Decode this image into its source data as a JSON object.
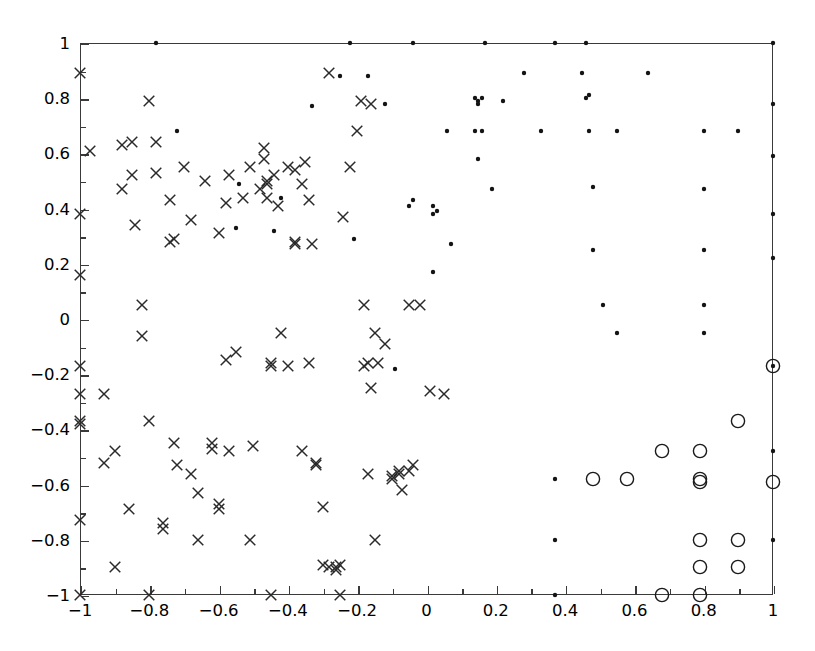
{
  "chart_data": {
    "type": "scatter",
    "title": "",
    "subtitle": "",
    "xlabel": "",
    "ylabel": "",
    "xlim": [
      -1,
      1
    ],
    "ylim": [
      -1,
      1
    ],
    "grid": false,
    "legend_position": "none",
    "x_ticks": [
      -1,
      -0.8,
      -0.6,
      -0.4,
      -0.2,
      0,
      0.2,
      0.4,
      0.6,
      0.8,
      1
    ],
    "x_tick_labels": [
      "-1",
      "-0.8",
      "-0.6",
      "-0.4",
      "-0.2",
      "0",
      "0.2",
      "0.4",
      "0.6",
      "0.8",
      "1"
    ],
    "y_ticks": [
      -1,
      -0.8,
      -0.6,
      -0.4,
      -0.2,
      0,
      0.2,
      0.4,
      0.6,
      0.8,
      1
    ],
    "y_tick_labels": [
      "-1",
      "-0.8",
      "-0.6",
      "-0.4",
      "-0.2",
      "0",
      "0.2",
      "0.4",
      "0.6",
      "0.8",
      "1"
    ],
    "minor_ticks": true,
    "marker_color": "#1a1a1a",
    "axis_color": "#3a3a3a",
    "series": [
      {
        "name": "cross-markers",
        "marker": "x",
        "size": 13,
        "color": "#2a2a2a",
        "points": [
          [
            -1.0,
            0.89
          ],
          [
            -1.0,
            0.38
          ],
          [
            -1.0,
            0.16
          ],
          [
            -1.0,
            -0.17
          ],
          [
            -1.0,
            -0.27
          ],
          [
            -1.0,
            -0.37
          ],
          [
            -1.0,
            -0.38
          ],
          [
            -1.0,
            -0.73
          ],
          [
            -1.0,
            -1.0
          ],
          [
            -0.97,
            0.61
          ],
          [
            -0.93,
            -0.27
          ],
          [
            -0.93,
            -0.52
          ],
          [
            -0.9,
            -0.9
          ],
          [
            -0.9,
            -0.48
          ],
          [
            -0.88,
            0.63
          ],
          [
            -0.88,
            0.47
          ],
          [
            -0.86,
            -0.69
          ],
          [
            -0.85,
            0.64
          ],
          [
            -0.85,
            0.52
          ],
          [
            -0.84,
            0.34
          ],
          [
            -0.82,
            0.05
          ],
          [
            -0.82,
            -0.06
          ],
          [
            -0.8,
            0.79
          ],
          [
            -0.8,
            -0.37
          ],
          [
            -0.8,
            -1.0
          ],
          [
            -0.78,
            0.53
          ],
          [
            -0.78,
            0.64
          ],
          [
            -0.76,
            -0.74
          ],
          [
            -0.76,
            -0.76
          ],
          [
            -0.74,
            0.43
          ],
          [
            -0.74,
            0.28
          ],
          [
            -0.73,
            0.29
          ],
          [
            -0.73,
            -0.45
          ],
          [
            -0.72,
            -0.53
          ],
          [
            -0.7,
            0.55
          ],
          [
            -0.68,
            0.36
          ],
          [
            -0.68,
            -0.56
          ],
          [
            -0.66,
            -0.8
          ],
          [
            -0.66,
            -0.63
          ],
          [
            -0.64,
            0.5
          ],
          [
            -0.62,
            -0.45
          ],
          [
            -0.62,
            -0.47
          ],
          [
            -0.6,
            0.31
          ],
          [
            -0.6,
            -0.69
          ],
          [
            -0.6,
            -0.67
          ],
          [
            -0.58,
            0.42
          ],
          [
            -0.58,
            -0.15
          ],
          [
            -0.57,
            0.52
          ],
          [
            -0.57,
            -0.48
          ],
          [
            -0.55,
            -0.12
          ],
          [
            -0.53,
            0.44
          ],
          [
            -0.51,
            0.55
          ],
          [
            -0.51,
            -0.8
          ],
          [
            -0.5,
            -0.46
          ],
          [
            -0.48,
            0.47
          ],
          [
            -0.47,
            0.62
          ],
          [
            -0.47,
            0.58
          ],
          [
            -0.46,
            0.49
          ],
          [
            -0.46,
            0.5
          ],
          [
            -0.46,
            0.44
          ],
          [
            -0.45,
            -0.17
          ],
          [
            -0.45,
            -0.16
          ],
          [
            -0.44,
            0.52
          ],
          [
            -0.43,
            0.41
          ],
          [
            -0.42,
            -0.05
          ],
          [
            -0.4,
            0.55
          ],
          [
            -0.4,
            -0.17
          ],
          [
            -0.38,
            0.54
          ],
          [
            -0.38,
            0.27
          ],
          [
            -0.38,
            0.28
          ],
          [
            -0.36,
            0.49
          ],
          [
            -0.36,
            -0.48
          ],
          [
            -0.35,
            0.57
          ],
          [
            -0.34,
            0.43
          ],
          [
            -0.34,
            -0.16
          ],
          [
            -0.33,
            0.27
          ],
          [
            -0.32,
            -0.53
          ],
          [
            -0.32,
            -0.52
          ],
          [
            -0.3,
            -0.89
          ],
          [
            -0.3,
            -0.68
          ],
          [
            -0.28,
            0.89
          ],
          [
            -0.28,
            -0.9
          ],
          [
            -0.26,
            -0.9
          ],
          [
            -0.26,
            -0.91
          ],
          [
            -0.25,
            -0.89
          ],
          [
            -0.25,
            -1.0
          ],
          [
            -0.24,
            0.37
          ],
          [
            -0.22,
            0.55
          ],
          [
            -0.2,
            0.68
          ],
          [
            -0.19,
            0.79
          ],
          [
            -0.18,
            0.05
          ],
          [
            -0.18,
            -0.17
          ],
          [
            -0.17,
            -0.16
          ],
          [
            -0.17,
            -0.56
          ],
          [
            -0.16,
            0.78
          ],
          [
            -0.16,
            -0.25
          ],
          [
            -0.15,
            -0.05
          ],
          [
            -0.15,
            -0.8
          ],
          [
            -0.14,
            -0.16
          ],
          [
            -0.12,
            -0.09
          ],
          [
            -0.1,
            -0.57
          ],
          [
            -0.1,
            -0.58
          ],
          [
            -0.08,
            -0.56
          ],
          [
            -0.08,
            -0.55
          ],
          [
            -0.07,
            -0.62
          ],
          [
            -0.05,
            0.05
          ],
          [
            -0.05,
            -0.55
          ],
          [
            -0.04,
            -0.53
          ],
          [
            -0.02,
            0.05
          ],
          [
            0.01,
            -0.26
          ],
          [
            0.05,
            -0.27
          ],
          [
            -0.45,
            -1.0
          ]
        ]
      },
      {
        "name": "dot-markers",
        "marker": "o-filled",
        "size": 5,
        "color": "#141414",
        "points": [
          [
            -0.78,
            1.0
          ],
          [
            -0.22,
            1.0
          ],
          [
            -0.04,
            1.0
          ],
          [
            0.17,
            1.0
          ],
          [
            0.37,
            1.0
          ],
          [
            0.46,
            1.0
          ],
          [
            1.0,
            1.0
          ],
          [
            -0.72,
            0.68
          ],
          [
            -0.25,
            0.88
          ],
          [
            -0.17,
            0.88
          ],
          [
            -0.12,
            0.78
          ],
          [
            0.06,
            0.68
          ],
          [
            0.14,
            0.8
          ],
          [
            0.16,
            0.8
          ],
          [
            0.15,
            0.79
          ],
          [
            0.15,
            0.78
          ],
          [
            0.14,
            0.68
          ],
          [
            0.16,
            0.68
          ],
          [
            0.22,
            0.79
          ],
          [
            0.28,
            0.89
          ],
          [
            0.33,
            0.68
          ],
          [
            0.45,
            0.89
          ],
          [
            0.46,
            0.8
          ],
          [
            0.47,
            0.81
          ],
          [
            0.47,
            0.68
          ],
          [
            0.55,
            0.68
          ],
          [
            0.64,
            0.89
          ],
          [
            0.8,
            0.68
          ],
          [
            0.9,
            0.68
          ],
          [
            0.8,
            0.47
          ],
          [
            0.8,
            0.25
          ],
          [
            0.8,
            0.05
          ],
          [
            0.8,
            -0.05
          ],
          [
            0.48,
            0.48
          ],
          [
            0.48,
            0.25
          ],
          [
            0.51,
            0.05
          ],
          [
            0.55,
            -0.05
          ],
          [
            0.02,
            0.38
          ],
          [
            0.02,
            0.41
          ],
          [
            0.03,
            0.39
          ],
          [
            -0.04,
            0.43
          ],
          [
            0.07,
            0.27
          ],
          [
            0.02,
            0.17
          ],
          [
            0.15,
            0.58
          ],
          [
            0.19,
            0.47
          ],
          [
            -0.33,
            0.77
          ],
          [
            -0.54,
            0.49
          ],
          [
            -0.55,
            0.33
          ],
          [
            -0.42,
            0.44
          ],
          [
            -0.44,
            0.32
          ],
          [
            -0.21,
            0.29
          ],
          [
            -0.05,
            0.41
          ],
          [
            -0.09,
            -0.18
          ],
          [
            0.37,
            -0.58
          ],
          [
            0.37,
            -0.8
          ],
          [
            0.37,
            -1.0
          ],
          [
            1.0,
            -0.17
          ],
          [
            1.0,
            -0.48
          ],
          [
            1.0,
            -0.8
          ],
          [
            1.0,
            0.78
          ],
          [
            1.0,
            0.59
          ],
          [
            1.0,
            0.38
          ],
          [
            1.0,
            0.22
          ]
        ]
      },
      {
        "name": "circle-markers",
        "marker": "o-open",
        "size": 15,
        "color": "#1a1a1a",
        "points": [
          [
            1.0,
            -0.17
          ],
          [
            0.9,
            -0.37
          ],
          [
            0.68,
            -0.48
          ],
          [
            0.79,
            -0.48
          ],
          [
            0.79,
            -0.58
          ],
          [
            0.79,
            -0.59
          ],
          [
            0.48,
            -0.58
          ],
          [
            0.58,
            -0.58
          ],
          [
            1.0,
            -0.59
          ],
          [
            0.79,
            -0.8
          ],
          [
            0.9,
            -0.8
          ],
          [
            0.79,
            -0.9
          ],
          [
            0.9,
            -0.9
          ],
          [
            0.68,
            -1.0
          ],
          [
            0.79,
            -1.0
          ]
        ]
      }
    ]
  }
}
